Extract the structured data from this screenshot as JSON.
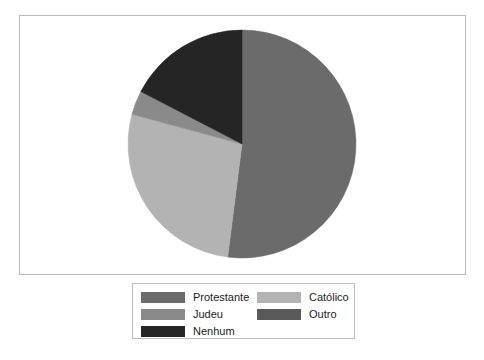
{
  "chart_data": {
    "type": "pie",
    "title": "",
    "categories": [
      "Protestante",
      "Católico",
      "Judeu",
      "Nenhum",
      "Outro"
    ],
    "values": [
      52.0,
      27.2,
      3.4,
      17.4,
      0.0
    ],
    "units": "percent",
    "start_angle_deg": 0,
    "direction": "clockwise",
    "legend_position": "bottom",
    "grid": false,
    "slices": [
      {
        "label": "Protestante",
        "value": 52.0,
        "color": "#6b6b6b",
        "start_deg": 0.0,
        "end_deg": 187.2
      },
      {
        "label": "Católico",
        "value": 27.2,
        "color": "#b3b3b3",
        "start_deg": 187.2,
        "end_deg": 285.1
      },
      {
        "label": "Judeu",
        "value": 3.4,
        "color": "#8a8a8a",
        "start_deg": 285.1,
        "end_deg": 297.4
      },
      {
        "label": "Nenhum",
        "value": 17.4,
        "color": "#252525",
        "start_deg": 297.4,
        "end_deg": 360.0
      },
      {
        "label": "Outro",
        "value": 0.0,
        "color": "#5a5a5a",
        "start_deg": 360.0,
        "end_deg": 360.0
      }
    ]
  },
  "plot": {
    "frame_color": "#b9b9b9",
    "background": "#ffffff",
    "center_x": 223,
    "center_y": 129,
    "radius": 114
  },
  "legend": {
    "border_color": "#bdbdbd",
    "columns": [
      {
        "items": [
          {
            "label": "Protestante",
            "color": "#6b6b6b"
          },
          {
            "label": "Judeu",
            "color": "#8a8a8a"
          },
          {
            "label": "Nenhum",
            "color": "#252525"
          }
        ]
      },
      {
        "items": [
          {
            "label": "Católico",
            "color": "#b3b3b3"
          },
          {
            "label": "Outro",
            "color": "#5a5a5a"
          }
        ]
      }
    ]
  }
}
